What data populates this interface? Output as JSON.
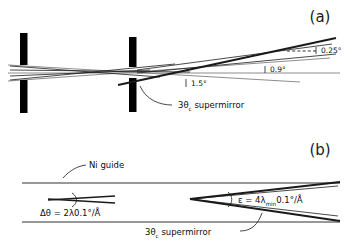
{
  "figure": {
    "background_color": "#ffffff",
    "line_color": "#1a1a1a",
    "axis_color": "#808080"
  },
  "panels": [
    {
      "id": "a",
      "label": "(a)",
      "elements": {
        "slit_count": 2,
        "angles": [
          {
            "name": "outer-divergence",
            "value": "0.25°"
          },
          {
            "name": "mid-divergence",
            "value": "0.9°"
          },
          {
            "name": "inner-divergence",
            "value": "1.5°"
          }
        ],
        "supermirror_label": {
          "prefix": "3θ",
          "subscript": "c",
          "suffix": " supermirror"
        }
      }
    },
    {
      "id": "b",
      "label": "(b)",
      "elements": {
        "guide_label": "Ni guide",
        "divergence_formula": {
          "prefix": "Δθ = 2λ0.1°/Å"
        },
        "epsilon_formula": {
          "prefix": "ε = 4λ",
          "subscript": "min",
          "suffix": "0.1°/Å"
        },
        "supermirror_label": {
          "prefix": "3θ",
          "subscript": "c",
          "suffix": " supermirror"
        }
      }
    }
  ]
}
